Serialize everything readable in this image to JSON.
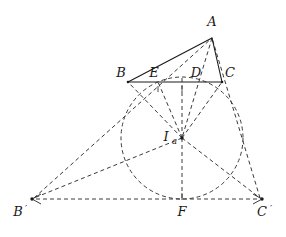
{
  "figure": {
    "type": "geometry-diagram",
    "background_color": "#ffffff",
    "stroke_color": "#3a3a3a",
    "solid_color": "#1a1a1a",
    "dash_pattern": "4 3"
  },
  "points": [
    {
      "id": "A",
      "label": "A",
      "x": 212,
      "y": 38,
      "label_x": 212,
      "label_y": 26,
      "marked": false
    },
    {
      "id": "B",
      "label": "B",
      "x": 128,
      "y": 82,
      "label_x": 121,
      "label_y": 77,
      "marked": true
    },
    {
      "id": "C",
      "label": "C",
      "x": 222,
      "y": 82,
      "label_x": 230,
      "label_y": 77,
      "marked": true
    },
    {
      "id": "E",
      "label": "E",
      "x": 158,
      "y": 82,
      "label_x": 154,
      "label_y": 77,
      "marked": true
    },
    {
      "id": "D",
      "label": "D",
      "x": 199,
      "y": 82,
      "label_x": 196,
      "label_y": 77,
      "marked": true
    },
    {
      "id": "Ia",
      "label": "I",
      "sub": "a",
      "x": 182,
      "y": 138,
      "label_x": 166,
      "label_y": 141,
      "marked": true
    },
    {
      "id": "Bp",
      "label": "B",
      "prime": "′",
      "x": 32,
      "y": 199,
      "label_x": 22,
      "label_y": 216,
      "marked": true
    },
    {
      "id": "Cp",
      "label": "C",
      "prime": "′",
      "x": 262,
      "y": 199,
      "label_x": 263,
      "label_y": 216,
      "marked": true
    },
    {
      "id": "F",
      "label": "F",
      "x": 182,
      "y": 199,
      "label_x": 182,
      "label_y": 216,
      "marked": true
    },
    {
      "id": "T",
      "label": "",
      "x": 182,
      "y": 77,
      "marked": false
    },
    {
      "id": "P",
      "label": "",
      "x": 134,
      "y": 176,
      "marked": false
    },
    {
      "id": "Q",
      "label": "",
      "x": 231,
      "y": 177,
      "marked": false
    }
  ],
  "circle": {
    "id": "excircle",
    "cx": 182,
    "cy": 138,
    "r": 61,
    "style": "dashed"
  },
  "solid_segments": [
    {
      "id": "AB",
      "from": "A",
      "to": "B"
    },
    {
      "id": "AC",
      "from": "A",
      "to": "C"
    },
    {
      "id": "BC",
      "from": "B",
      "to": "C"
    }
  ],
  "dashed_segments": [
    {
      "id": "A-Ia",
      "from": "A",
      "to": "Ia"
    },
    {
      "id": "Ia-B",
      "from": "Ia",
      "to": "B"
    },
    {
      "id": "Ia-E",
      "from": "Ia",
      "to": "E"
    },
    {
      "id": "Ia-T",
      "from": "Ia",
      "to": "T"
    },
    {
      "id": "Ia-C",
      "from": "Ia",
      "to": "C"
    },
    {
      "id": "Ia-F",
      "from": "Ia",
      "to": "F"
    },
    {
      "id": "Ia-Bp",
      "from": "Ia",
      "to": "Bp"
    },
    {
      "id": "Ia-Cp",
      "from": "Ia",
      "to": "Cp"
    },
    {
      "id": "Bp-B-A",
      "from": "Bp",
      "to": "A"
    },
    {
      "id": "Cp-C-A",
      "from": "Cp",
      "to": "A"
    },
    {
      "id": "Bp-Cp",
      "from": "Bp",
      "to": "Cp"
    }
  ],
  "arrow_endpoints": [
    "Bp",
    "Cp"
  ],
  "tick_marks": [
    {
      "at": "E",
      "orientation": "vertical"
    },
    {
      "at": "T",
      "orientation": "vertical"
    },
    {
      "at": "F",
      "orientation": "vertical"
    }
  ]
}
